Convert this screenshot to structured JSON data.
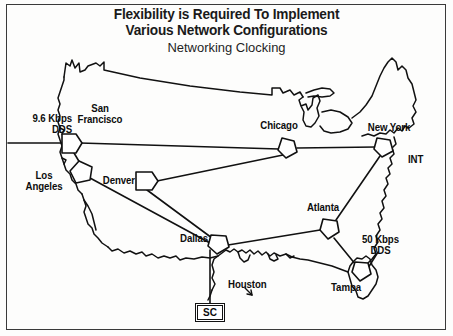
{
  "figure": {
    "title_line1": "Flexibility is Required To Implement",
    "title_line2": "Various Network Configurations",
    "subtitle": "Networking Clocking"
  },
  "diagram": {
    "type": "network-topology-map",
    "region": "United States",
    "nodes": [
      {
        "id": "san-francisco",
        "label": "San\nFrancisco",
        "label_line1": "San",
        "label_line2": "Francisco",
        "x": 70,
        "y": 143
      },
      {
        "id": "los-angeles",
        "label": "Los Angeles",
        "label_line1": "Los",
        "label_line2": "Angeles",
        "x": 80,
        "y": 172
      },
      {
        "id": "denver",
        "label": "Denver",
        "x": 147,
        "y": 180
      },
      {
        "id": "chicago",
        "label": "Chicago",
        "x": 288,
        "y": 148
      },
      {
        "id": "new-york",
        "label": "New York",
        "x": 385,
        "y": 148
      },
      {
        "id": "dallas",
        "label": "Dallas",
        "x": 218,
        "y": 245
      },
      {
        "id": "atlanta",
        "label": "Atlanta",
        "x": 330,
        "y": 228
      },
      {
        "id": "tampa",
        "label": "Tampa",
        "x": 362,
        "y": 272
      }
    ],
    "links": [
      {
        "from": "dds-9600",
        "to": "san-francisco"
      },
      {
        "from": "san-francisco",
        "to": "chicago"
      },
      {
        "from": "san-francisco",
        "to": "los-angeles"
      },
      {
        "from": "chicago",
        "to": "new-york"
      },
      {
        "from": "chicago",
        "to": "denver"
      },
      {
        "from": "denver",
        "to": "dallas"
      },
      {
        "from": "los-angeles",
        "to": "dallas"
      },
      {
        "from": "dallas",
        "to": "atlanta"
      },
      {
        "from": "dallas",
        "to": "sc"
      },
      {
        "from": "atlanta",
        "to": "new-york"
      },
      {
        "from": "atlanta",
        "to": "tampa"
      },
      {
        "from": "tampa",
        "to": "dds-50k"
      }
    ],
    "annotations": [
      {
        "id": "dds-9600",
        "line1": "9.6 Kbps",
        "line2": "DDS",
        "x": 10,
        "y": 118
      },
      {
        "id": "dds-50k",
        "line1": "50 Kbps",
        "line2": "DDS",
        "x": 364,
        "y": 240
      },
      {
        "id": "int",
        "label": "INT",
        "x": 411,
        "y": 160
      },
      {
        "id": "houston",
        "label": "Houston",
        "x": 228,
        "y": 285
      },
      {
        "id": "sc",
        "label": "SC",
        "x": 195,
        "y": 303
      }
    ]
  },
  "colors": {
    "ink": "#111111",
    "background": "#fdfdfc",
    "frame": "#3a3a3a"
  }
}
